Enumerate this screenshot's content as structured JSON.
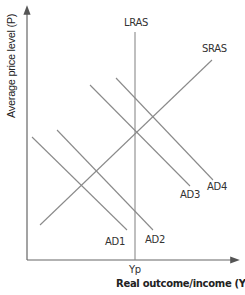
{
  "diagram": {
    "y_axis_label": "Average price level (P)",
    "x_axis_label": "Real outcome/income (Yr)",
    "curves": {
      "lras": "LRAS",
      "sras": "SRAS",
      "ad1": "AD1",
      "ad2": "AD2",
      "ad3": "AD3",
      "ad4": "AD4"
    },
    "x_tick": "Yp",
    "line_color": "#8a8a8a",
    "axis_color": "#666666"
  }
}
